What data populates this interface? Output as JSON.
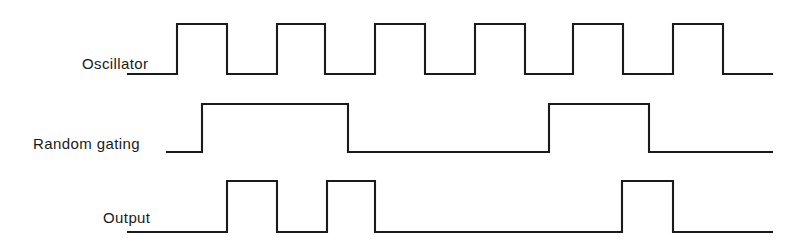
{
  "figure": {
    "kind": "digital-timing-diagram",
    "background_color": "#ffffff",
    "line_color": "#1a1a1a",
    "width": 803,
    "height": 252
  },
  "labels": {
    "oscillator": "Oscillator",
    "random_gating": "Random gating",
    "output": "Output"
  },
  "chart_data": {
    "type": "line",
    "title": "",
    "xlabel": "",
    "ylabel": "",
    "legend_position": "left-labels",
    "grid": false,
    "x_range": [
      128,
      772
    ],
    "series": [
      {
        "name": "Oscillator",
        "label": "Oscillator",
        "level_high_y": 24,
        "level_low_y": 74,
        "start_x": 128,
        "end_x": 772,
        "initial_level": "low",
        "transitions": [
          177,
          227,
          277,
          325,
          375,
          425,
          475,
          525,
          573,
          623,
          673,
          723
        ],
        "pulses": [
          [
            177,
            227
          ],
          [
            277,
            325
          ],
          [
            375,
            425
          ],
          [
            475,
            525
          ],
          [
            573,
            623
          ],
          [
            673,
            723
          ]
        ],
        "pulse_count": 6,
        "period_px": 99,
        "duty_cycle_percent": 50
      },
      {
        "name": "Random gating",
        "label": "Random gating",
        "level_high_y": 104,
        "level_low_y": 152,
        "start_x": 167,
        "end_x": 772,
        "initial_level": "low",
        "transitions": [
          202,
          348,
          549,
          649
        ],
        "pulses": [
          [
            202,
            348
          ],
          [
            549,
            649
          ]
        ],
        "pulse_count": 2
      },
      {
        "name": "Output",
        "label": "Output",
        "level_high_y": 181,
        "level_low_y": 232,
        "start_x": 128,
        "end_x": 772,
        "initial_level": "low",
        "transitions": [
          227,
          277,
          327,
          375,
          622,
          673
        ],
        "pulses": [
          [
            227,
            277
          ],
          [
            327,
            375
          ],
          [
            622,
            673
          ]
        ],
        "pulse_count": 3
      }
    ]
  }
}
